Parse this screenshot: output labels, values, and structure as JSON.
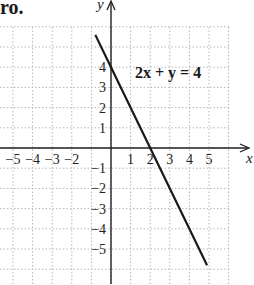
{
  "header_fragment": "ro.",
  "chart_data": {
    "type": "line",
    "title": "",
    "equation_label": "2x + y = 4",
    "xlabel": "x",
    "ylabel": "y",
    "xlim": [
      -5.7,
      6
    ],
    "ylim": [
      -6.8,
      6
    ],
    "grid": true,
    "grid_style": "dotted",
    "x_ticks": [
      -5,
      -4,
      -3,
      -2,
      1,
      2,
      3,
      4,
      5
    ],
    "x_tick_labels": [
      "−5",
      "−4",
      "−3",
      "−2",
      "1",
      "2",
      "3",
      "4",
      "5"
    ],
    "y_ticks": [
      4,
      3,
      2,
      1,
      -1,
      -2,
      -3,
      -4,
      -5
    ],
    "y_tick_labels": [
      "4",
      "3",
      "2",
      "1",
      "−1",
      "−2",
      "−3",
      "−4",
      "−5"
    ],
    "series": [
      {
        "name": "2x + y = 4",
        "x": [
          -0.8,
          0,
          2,
          4.9
        ],
        "y": [
          5.6,
          4,
          0,
          -5.8
        ],
        "color": "#1a1a1a"
      }
    ],
    "intercepts": {
      "x_intercept": 2,
      "y_intercept": 4
    }
  }
}
